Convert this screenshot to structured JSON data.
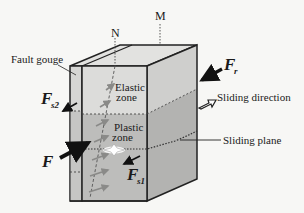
{
  "diagram": {
    "type": "3d-block-fault-model",
    "labels": {
      "axis_n": "N",
      "axis_m": "M",
      "fault_gouge": "Fault gouge",
      "elastic_zone_line1": "Elastic",
      "elastic_zone_line2": "zone",
      "plastic_zone_line1": "Plastic",
      "plastic_zone_line2": "zone",
      "sliding_direction": "Sliding direction",
      "sliding_plane": "Sliding plane",
      "force_main": "F",
      "force_r": "F",
      "force_r_sub": "r",
      "force_s1": "F",
      "force_s1_sub": "s1",
      "force_s2": "F",
      "force_s2_sub": "s2"
    },
    "colors": {
      "background": "#f7f7f5",
      "block_light": "#d9d9d7",
      "block_top": "#e2e2e0",
      "block_side": "#cfcfcd",
      "plastic": "#bdbdbb",
      "plastic_side": "#b3b3b1",
      "outline": "#222222",
      "dotted": "#444444",
      "arrow_inner": "#8a8a88"
    }
  }
}
